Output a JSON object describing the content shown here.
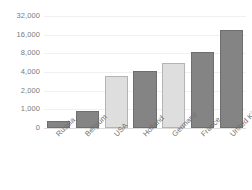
{
  "chart_data": {
    "type": "bar",
    "title": "",
    "xlabel": "",
    "ylabel": "",
    "categories": [
      "Russia",
      "Belgium",
      "USA",
      "Holland",
      "Germany",
      "France",
      "United Kingdom"
    ],
    "values": [
      400,
      900,
      3600,
      4300,
      5900,
      8500,
      20000
    ],
    "series": [
      {
        "name": "",
        "values": [
          400,
          900,
          3600,
          4300,
          5900,
          8500,
          20000
        ]
      }
    ],
    "bar_styles": [
      "dark",
      "dark",
      "light",
      "dark",
      "light",
      "dark",
      "dark"
    ],
    "y_ticks": [
      0,
      1000,
      2000,
      4000,
      8000,
      16000,
      32000
    ],
    "y_tick_labels": [
      "0",
      "1,000",
      "2,000",
      "4,000",
      "8,000",
      "16,000",
      "32,000"
    ],
    "y_scale": "log-like",
    "ylim": [
      0,
      32000
    ],
    "grid": true,
    "legend": "none",
    "colors": {
      "bar_dark_fill": "#848484",
      "bar_dark_stroke": "#6e6e6e",
      "bar_light_fill": "#dedede",
      "bar_light_stroke": "#b4b4b4",
      "gridline": "#f0f0f0",
      "baseline": "#dcdcdc",
      "tick_text": "#7a7a7a",
      "background": "#ffffff"
    }
  }
}
